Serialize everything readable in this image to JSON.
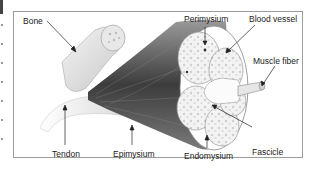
{
  "diagram": {
    "labels": {
      "bone": "Bone",
      "perimysium": "Perimysium",
      "blood_vessel": "Blood vessel",
      "muscle_fiber": "Muscle fiber",
      "tendon": "Tendon",
      "epimysium": "Epimysium",
      "endomysium": "Endomysium",
      "fascicle": "Fascicle"
    },
    "colors": {
      "frame_border": "#9c9c9c",
      "label_text": "#222222",
      "muscle_shade_dark": "#3a3a3a",
      "muscle_shade_light": "#bdbdbd",
      "fascicle_fill": "#f2f2f2"
    }
  }
}
